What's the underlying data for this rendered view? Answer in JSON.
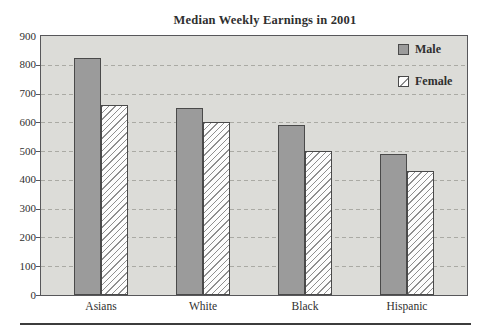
{
  "chart_data": {
    "type": "bar",
    "title": "Median Weekly Earnings in 2001",
    "categories": [
      "Asians",
      "White",
      "Black",
      "Hispanic"
    ],
    "series": [
      {
        "name": "Male",
        "values": [
          825,
          650,
          590,
          490
        ]
      },
      {
        "name": "Female",
        "values": [
          660,
          600,
          500,
          430
        ]
      }
    ],
    "xlabel": "",
    "ylabel": "",
    "ylim": [
      0,
      900
    ],
    "ytick_step": 100,
    "ytick_labels": [
      "0",
      "100",
      "200",
      "300",
      "400",
      "500",
      "600",
      "700",
      "800",
      "900"
    ],
    "grid": "dashed-horizontal",
    "legend_position": "top-right"
  },
  "colors": {
    "male_fill": "#9b9b9b",
    "female_fill": "#fdfdfd",
    "female_hatch": "#8f8f8f",
    "plot_bg": "#dcdcd8",
    "gridline": "#aaaaa4",
    "axis": "#57575a",
    "bar_border": "#4a4a4a",
    "text": "#2f2f2f",
    "bottom_rule": "#3c3c3c"
  }
}
